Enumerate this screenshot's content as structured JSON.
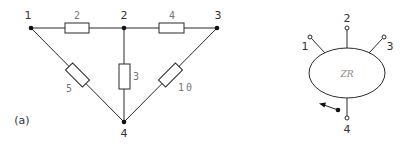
{
  "figure_label": "(a)",
  "left_network": {
    "nodes": [
      {
        "id": "1",
        "label": "1",
        "x": 31,
        "y": 28
      },
      {
        "id": "2",
        "label": "2",
        "x": 124,
        "y": 28
      },
      {
        "id": "3",
        "label": "3",
        "x": 217,
        "y": 28
      },
      {
        "id": "4",
        "label": "4",
        "x": 124,
        "y": 122
      }
    ],
    "resistors": [
      {
        "from": "1",
        "to": "2",
        "value": "2"
      },
      {
        "from": "2",
        "to": "3",
        "value": "4"
      },
      {
        "from": "2",
        "to": "4",
        "value": "3"
      },
      {
        "from": "1",
        "to": "4",
        "value": "5"
      },
      {
        "from": "3",
        "to": "4",
        "value": "10"
      }
    ]
  },
  "right_network": {
    "block_label": "ZR",
    "terminals": [
      {
        "id": "1",
        "label": "1"
      },
      {
        "id": "2",
        "label": "2"
      },
      {
        "id": "3",
        "label": "3"
      },
      {
        "id": "4",
        "label": "4"
      }
    ]
  }
}
